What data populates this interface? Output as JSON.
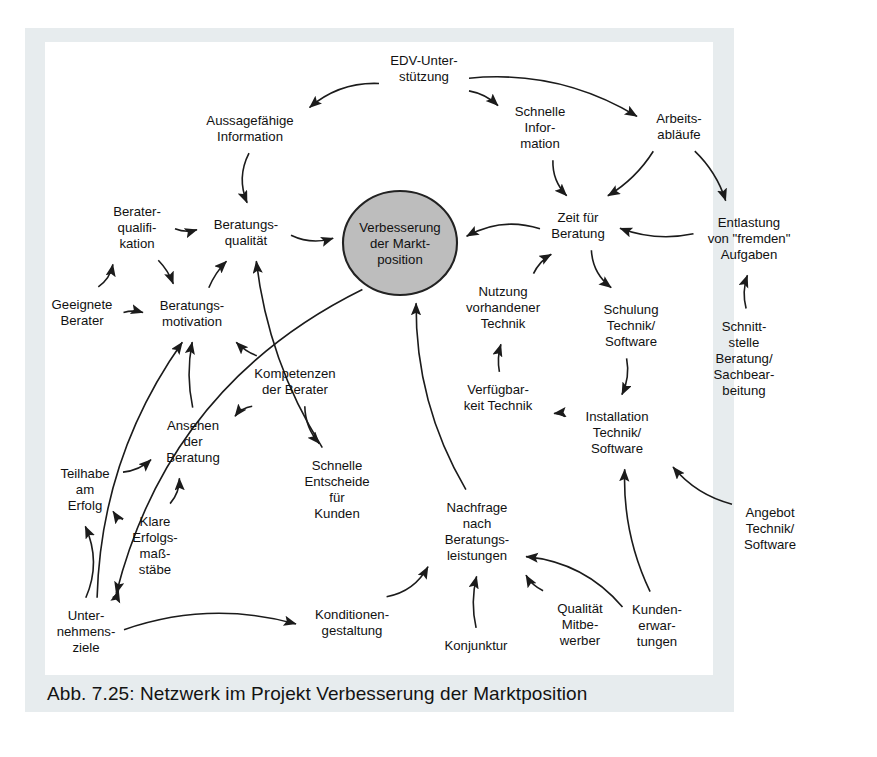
{
  "figure": {
    "caption": "Abb. 7.25: Netzwerk im Projekt Verbesserung der Marktposition",
    "background_color": "#ffffff",
    "mat_color": "#e7ecee",
    "plate_color": "#ffffff",
    "ink_color": "#1b1b1b",
    "hub_fill": "#bdbdbd"
  },
  "chart_data": {
    "type": "diagram",
    "title": "Netzwerk im Projekt Verbesserung der Marktposition",
    "diagram_kind": "causal-network",
    "hub": {
      "id": "verbesserung",
      "label": "Verbesserung der Markt-position",
      "lines": [
        "Verbesserung",
        "der Markt-",
        "position"
      ],
      "shape": "ellipse",
      "fill": "#bdbdbd",
      "x": 400,
      "y": 243,
      "rx": 57,
      "ry": 52
    },
    "nodes": [
      {
        "id": "edv",
        "lines": [
          "EDV-Unter-",
          "stützung"
        ],
        "x": 424,
        "y": 68
      },
      {
        "id": "aussage",
        "lines": [
          "Aussagefähige",
          "Information"
        ],
        "x": 250,
        "y": 128
      },
      {
        "id": "schnelle_info",
        "lines": [
          "Schnelle",
          "Infor-",
          "mation"
        ],
        "x": 540,
        "y": 127
      },
      {
        "id": "arbeitsabl",
        "lines": [
          "Arbeits-",
          "abläufe"
        ],
        "x": 679,
        "y": 126
      },
      {
        "id": "entlastung",
        "lines": [
          "Entlastung",
          "von \"fremden\"",
          "Aufgaben"
        ],
        "x": 749,
        "y": 238
      },
      {
        "id": "beratungsq",
        "lines": [
          "Beratungs-",
          "qualität"
        ],
        "x": 246,
        "y": 232
      },
      {
        "id": "beraterqual",
        "lines": [
          "Berater-",
          "qualifi-",
          "kation"
        ],
        "x": 137,
        "y": 227
      },
      {
        "id": "geeignete",
        "lines": [
          "Geeignete",
          "Berater"
        ],
        "x": 82,
        "y": 312
      },
      {
        "id": "beratungsm",
        "lines": [
          "Beratungs-",
          "motivation"
        ],
        "x": 192,
        "y": 313
      },
      {
        "id": "zeit",
        "lines": [
          "Zeit für",
          "Beratung"
        ],
        "x": 578,
        "y": 225
      },
      {
        "id": "nutzung",
        "lines": [
          "Nutzung",
          "vorhandener",
          "Technik"
        ],
        "x": 503,
        "y": 307
      },
      {
        "id": "schulung",
        "lines": [
          "Schulung",
          "Technik/",
          "Software"
        ],
        "x": 631,
        "y": 325
      },
      {
        "id": "schnittst",
        "lines": [
          "Schnitt-",
          "stelle",
          "Beratung/",
          "Sachbear-",
          "beitung"
        ],
        "x": 744,
        "y": 358
      },
      {
        "id": "verfuegbar",
        "lines": [
          "Verfügbar-",
          "keit Technik"
        ],
        "x": 498,
        "y": 397
      },
      {
        "id": "installation",
        "lines": [
          "Installation",
          "Technik/",
          "Software"
        ],
        "x": 617,
        "y": 432
      },
      {
        "id": "kompetenzen",
        "lines": [
          "Kompetenzen",
          "der Berater"
        ],
        "x": 295,
        "y": 381
      },
      {
        "id": "ansehen",
        "lines": [
          "Ansehen",
          "der",
          "Beratung"
        ],
        "x": 193,
        "y": 441
      },
      {
        "id": "schnelle_ent",
        "lines": [
          "Schnelle",
          "Entscheide",
          "für",
          "Kunden"
        ],
        "x": 337,
        "y": 489
      },
      {
        "id": "teilhabe",
        "lines": [
          "Teilhabe",
          "am",
          "Erfolg"
        ],
        "x": 85,
        "y": 489
      },
      {
        "id": "klare",
        "lines": [
          "Klare",
          "Erfolgs-",
          "maß-",
          "stäbe"
        ],
        "x": 155,
        "y": 545
      },
      {
        "id": "unternehmen",
        "lines": [
          "Unter-",
          "nehmens-",
          "ziele"
        ],
        "x": 86,
        "y": 631
      },
      {
        "id": "konditionen",
        "lines": [
          "Konditionen-",
          "gestaltung"
        ],
        "x": 352,
        "y": 622
      },
      {
        "id": "nachfrage",
        "lines": [
          "Nachfrage",
          "nach",
          "Beratungs-",
          "leistungen"
        ],
        "x": 477,
        "y": 531
      },
      {
        "id": "konjunktur",
        "lines": [
          "Konjunktur"
        ],
        "x": 476,
        "y": 645
      },
      {
        "id": "qualitaet",
        "lines": [
          "Qualität",
          "Mitbe-",
          "werber"
        ],
        "x": 580,
        "y": 624
      },
      {
        "id": "kunden",
        "lines": [
          "Kunden-",
          "erwar-",
          "tungen"
        ],
        "x": 657,
        "y": 625
      },
      {
        "id": "angebot",
        "lines": [
          "Angebot",
          "Technik/",
          "Software"
        ],
        "x": 770,
        "y": 528
      }
    ],
    "edges": [
      {
        "from": "edv",
        "to": "aussage"
      },
      {
        "from": "edv",
        "to": "schnelle_info"
      },
      {
        "from": "edv",
        "to": "arbeitsabl"
      },
      {
        "from": "aussage",
        "to": "beratungsq"
      },
      {
        "from": "schnelle_info",
        "to": "zeit"
      },
      {
        "from": "arbeitsabl",
        "to": "zeit"
      },
      {
        "from": "arbeitsabl",
        "to": "entlastung"
      },
      {
        "from": "entlastung",
        "to": "zeit"
      },
      {
        "from": "schnittst",
        "to": "entlastung"
      },
      {
        "from": "beratungsq",
        "to": "verbesserung"
      },
      {
        "from": "zeit",
        "to": "verbesserung"
      },
      {
        "from": "beraterqual",
        "to": "beratungsq"
      },
      {
        "from": "beraterqual",
        "to": "beratungsm"
      },
      {
        "from": "beratungsm",
        "to": "beratungsq"
      },
      {
        "from": "geeignete",
        "to": "beratungsm"
      },
      {
        "from": "geeignete",
        "to": "beraterqual"
      },
      {
        "from": "kompetenzen",
        "to": "beratungsm"
      },
      {
        "from": "kompetenzen",
        "to": "ansehen"
      },
      {
        "from": "kompetenzen",
        "to": "schnelle_ent"
      },
      {
        "from": "ansehen",
        "to": "beratungsm"
      },
      {
        "from": "schnelle_ent",
        "to": "beratungsq"
      },
      {
        "from": "teilhabe",
        "to": "ansehen"
      },
      {
        "from": "teilhabe",
        "to": "klare"
      },
      {
        "from": "klare",
        "to": "ansehen"
      },
      {
        "from": "unternehmen",
        "to": "teilhabe"
      },
      {
        "from": "unternehmen",
        "to": "klare"
      },
      {
        "from": "unternehmen",
        "to": "konditionen"
      },
      {
        "from": "unternehmen",
        "to": "beratungsm"
      },
      {
        "from": "konditionen",
        "to": "nachfrage"
      },
      {
        "from": "konjunktur",
        "to": "nachfrage"
      },
      {
        "from": "qualitaet",
        "to": "nachfrage"
      },
      {
        "from": "kunden",
        "to": "nachfrage"
      },
      {
        "from": "kunden",
        "to": "installation"
      },
      {
        "from": "nachfrage",
        "to": "verbesserung"
      },
      {
        "from": "verbesserung",
        "to": "unternehmen"
      },
      {
        "from": "zeit",
        "to": "schulung"
      },
      {
        "from": "schulung",
        "to": "installation"
      },
      {
        "from": "installation",
        "to": "verfuegbar"
      },
      {
        "from": "verfuegbar",
        "to": "nutzung"
      },
      {
        "from": "nutzung",
        "to": "zeit"
      },
      {
        "from": "angebot",
        "to": "installation"
      }
    ]
  }
}
